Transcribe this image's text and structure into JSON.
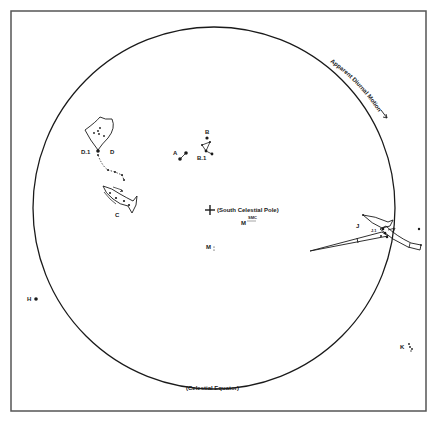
{
  "diagram": {
    "type": "celestial sky chart (southern hemisphere)",
    "colors": {
      "ink": "#1a1a1a",
      "frame": "#555555",
      "background": "#ffffff"
    },
    "frame": {
      "x": 11,
      "y": 11,
      "width": 415,
      "height": 400
    },
    "circle": {
      "cx": 214,
      "cy": 208,
      "r": 181
    },
    "labels": {
      "diurnal_motion": "Apparent Diurnal Motion",
      "south_pole": "(South Celestial Pole)",
      "celestial_equator": "(Celestial Equator)",
      "m_upper": "M",
      "m_upper_note": "SMC",
      "m_lower": "M",
      "a": "A",
      "b": "B",
      "b1": "B.1",
      "c": "C",
      "d": "D",
      "d1": "D.1",
      "h": "H",
      "j": "J",
      "j1": "J.1",
      "k": "K"
    }
  }
}
